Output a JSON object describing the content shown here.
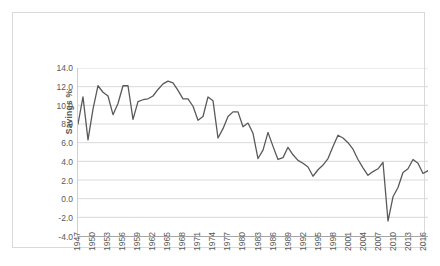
{
  "chart_data": {
    "type": "line",
    "title": "",
    "xlabel": "",
    "ylabel": "Savings %",
    "ylim": [
      -4.0,
      14.0
    ],
    "ytick_step": 2.0,
    "yticks": [
      "14.0",
      "12.0",
      "10.0",
      "8.0",
      "6.0",
      "4.0",
      "2.0",
      "0.0",
      "-2.0",
      "-4.0"
    ],
    "ytick_values": [
      14.0,
      12.0,
      10.0,
      8.0,
      6.0,
      4.0,
      2.0,
      0.0,
      -2.0,
      -4.0
    ],
    "xlim": [
      1947,
      2017
    ],
    "xtick_labels": [
      "1947",
      "1950",
      "1953",
      "1956",
      "1959",
      "1962",
      "1965",
      "1968",
      "1971",
      "1974",
      "1977",
      "1980",
      "1983",
      "1986",
      "1989",
      "1992",
      "1995",
      "1998",
      "2001",
      "2004",
      "2007",
      "2010",
      "2013",
      "2016"
    ],
    "xtick_values": [
      1947,
      1950,
      1953,
      1956,
      1959,
      1962,
      1965,
      1968,
      1971,
      1974,
      1977,
      1980,
      1983,
      1986,
      1989,
      1992,
      1995,
      1998,
      2001,
      2004,
      2007,
      2010,
      2013,
      2016
    ],
    "grid": "horizontal",
    "legend": "none",
    "line_color": "#595959",
    "x": [
      1947,
      1948,
      1949,
      1950,
      1951,
      1952,
      1953,
      1954,
      1955,
      1956,
      1957,
      1958,
      1959,
      1960,
      1961,
      1962,
      1963,
      1964,
      1965,
      1966,
      1967,
      1968,
      1969,
      1970,
      1971,
      1972,
      1973,
      1974,
      1975,
      1976,
      1977,
      1978,
      1979,
      1980,
      1981,
      1982,
      1983,
      1984,
      1985,
      1986,
      1987,
      1988,
      1989,
      1990,
      1991,
      1992,
      1993,
      1994,
      1995,
      1996,
      1997,
      1998,
      1999,
      2000,
      2001,
      2002,
      2003,
      2004,
      2005,
      2006,
      2007,
      2008,
      2009,
      2010,
      2011,
      2012,
      2013,
      2014,
      2015,
      2016,
      2017
    ],
    "values": [
      8.0,
      10.9,
      6.3,
      9.6,
      12.1,
      11.4,
      11.0,
      9.0,
      10.2,
      12.1,
      12.1,
      8.5,
      10.4,
      10.6,
      10.7,
      11.0,
      11.7,
      12.3,
      12.6,
      12.4,
      11.6,
      10.7,
      10.7,
      9.9,
      8.4,
      8.8,
      10.9,
      10.5,
      6.5,
      7.5,
      8.8,
      9.3,
      9.3,
      7.7,
      8.1,
      7.0,
      4.3,
      5.2,
      7.1,
      5.6,
      4.2,
      4.4,
      5.5,
      4.7,
      4.1,
      3.8,
      3.4,
      2.4,
      3.1,
      3.6,
      4.3,
      5.6,
      6.8,
      6.5,
      6.0,
      5.3,
      4.2,
      3.3,
      2.5,
      2.9,
      3.2,
      3.9,
      -2.4,
      0.2,
      1.2,
      2.8,
      3.2,
      4.2,
      3.8,
      2.7,
      3.0
    ]
  }
}
